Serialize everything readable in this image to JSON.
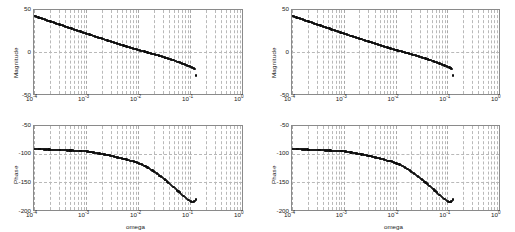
{
  "figure": {
    "background": "#ffffff",
    "marker_color": "#0d0d0d",
    "axis_color": "#8a8a8a",
    "grid_color": "#b9b9b9",
    "layout": "2 rows x 2 columns of Bode plots"
  },
  "panels": [
    {
      "id": "top-left",
      "kind": "magnitude",
      "ylabel": "Magnitude",
      "xlabel": "",
      "yticks": [
        "50",
        "0",
        "-50"
      ],
      "xticks": [
        "10",
        "10",
        "10",
        "10",
        "10"
      ],
      "xtick_exponents": [
        "-4",
        "-3",
        "-2",
        "-1",
        "0"
      ]
    },
    {
      "id": "top-right",
      "kind": "magnitude",
      "ylabel": "Magnitude",
      "xlabel": "",
      "yticks": [
        "50",
        "0",
        "-50"
      ],
      "xticks": [
        "10",
        "10",
        "10",
        "10",
        "10"
      ],
      "xtick_exponents": [
        "-4",
        "-3",
        "-2",
        "-1",
        "0"
      ]
    },
    {
      "id": "bottom-left",
      "kind": "phase",
      "ylabel": "Phase",
      "xlabel": "omega",
      "yticks": [
        "-50",
        "-100",
        "-150",
        "-200"
      ],
      "xticks": [
        "10",
        "10",
        "10",
        "10",
        "10"
      ],
      "xtick_exponents": [
        "-4",
        "-3",
        "-2",
        "-1",
        "0"
      ]
    },
    {
      "id": "bottom-right",
      "kind": "phase",
      "ylabel": "Phase",
      "xlabel": "omega",
      "yticks": [
        "-50",
        "-100",
        "-150",
        "-200"
      ],
      "xticks": [
        "10",
        "10",
        "10",
        "10",
        "10"
      ],
      "xtick_exponents": [
        "-4",
        "-3",
        "-2",
        "-1",
        "0"
      ]
    }
  ],
  "chart_data": [
    {
      "type": "scatter",
      "id": "top-left",
      "title": "",
      "xlabel": "",
      "ylabel": "Magnitude",
      "xscale": "log",
      "xlim": [
        0.0001,
        1
      ],
      "ylim": [
        -50,
        50
      ],
      "grid": true,
      "legend": null,
      "xtick_labels": [
        "10^-4",
        "10^-3",
        "10^-2",
        "10^-1",
        "10^0"
      ],
      "ytick_labels": [
        "50",
        "0",
        "-50"
      ],
      "x": [
        0.0001,
        0.001,
        0.002,
        0.003,
        0.004,
        0.005,
        0.006,
        0.007,
        0.008,
        0.009,
        0.01,
        0.012,
        0.014,
        0.016,
        0.018,
        0.02,
        0.023,
        0.026,
        0.03,
        0.034,
        0.038,
        0.043,
        0.048,
        0.054,
        0.06,
        0.067,
        0.075,
        0.084,
        0.094,
        0.105,
        0.115,
        0.125,
        0.13
      ],
      "y": [
        43,
        22,
        16,
        12.5,
        10,
        8,
        6.5,
        5.2,
        4.2,
        3.3,
        2.5,
        1.2,
        0.1,
        -0.8,
        -1.7,
        -2.5,
        -3.6,
        -4.6,
        -5.8,
        -6.8,
        -7.8,
        -8.9,
        -9.9,
        -11.0,
        -12.0,
        -13.1,
        -14.2,
        -15.4,
        -16.6,
        -17.9,
        -19.0,
        -20.0,
        -28
      ]
    },
    {
      "type": "scatter",
      "id": "top-right",
      "title": "",
      "xlabel": "",
      "ylabel": "Magnitude",
      "xscale": "log",
      "xlim": [
        0.0001,
        1
      ],
      "ylim": [
        -50,
        50
      ],
      "grid": true,
      "legend": null,
      "xtick_labels": [
        "10^-4",
        "10^-3",
        "10^-2",
        "10^-1",
        "10^0"
      ],
      "ytick_labels": [
        "50",
        "0",
        "-50"
      ],
      "x": [
        0.0001,
        0.001,
        0.002,
        0.003,
        0.004,
        0.005,
        0.006,
        0.007,
        0.008,
        0.009,
        0.01,
        0.012,
        0.014,
        0.016,
        0.018,
        0.02,
        0.023,
        0.026,
        0.03,
        0.034,
        0.038,
        0.043,
        0.048,
        0.054,
        0.06,
        0.067,
        0.075,
        0.084,
        0.094,
        0.105,
        0.115,
        0.125,
        0.13
      ],
      "y": [
        43,
        22,
        16,
        12.5,
        10,
        8,
        6.5,
        5.2,
        4.2,
        3.3,
        2.5,
        1.2,
        0.1,
        -0.8,
        -1.7,
        -2.5,
        -3.6,
        -4.6,
        -5.8,
        -6.8,
        -7.8,
        -8.9,
        -9.9,
        -11.0,
        -12.0,
        -13.1,
        -14.2,
        -15.4,
        -16.6,
        -17.9,
        -19.0,
        -20.0,
        -28
      ]
    },
    {
      "type": "scatter",
      "id": "bottom-left",
      "title": "",
      "xlabel": "omega",
      "ylabel": "Phase",
      "xscale": "log",
      "xlim": [
        0.0001,
        1
      ],
      "ylim": [
        -200,
        -50
      ],
      "grid": true,
      "legend": null,
      "xtick_labels": [
        "10^-4",
        "10^-3",
        "10^-2",
        "10^-1",
        "10^0"
      ],
      "ytick_labels": [
        "-50",
        "-100",
        "-150",
        "-200"
      ],
      "x": [
        0.0001,
        0.001,
        0.002,
        0.003,
        0.004,
        0.005,
        0.006,
        0.007,
        0.008,
        0.009,
        0.01,
        0.012,
        0.014,
        0.016,
        0.018,
        0.02,
        0.023,
        0.026,
        0.03,
        0.034,
        0.038,
        0.043,
        0.048,
        0.054,
        0.06,
        0.067,
        0.075,
        0.084,
        0.094,
        0.105,
        0.115,
        0.125,
        0.13
      ],
      "y": [
        -91,
        -95,
        -100,
        -103,
        -106,
        -108,
        -110,
        -112,
        -113,
        -114,
        -116,
        -119,
        -122,
        -125,
        -128,
        -131,
        -135,
        -139,
        -143,
        -147,
        -151,
        -155,
        -159,
        -163,
        -167,
        -171,
        -175,
        -179,
        -182,
        -185,
        -186,
        -184,
        -181
      ]
    },
    {
      "type": "scatter",
      "id": "bottom-right",
      "title": "",
      "xlabel": "omega",
      "ylabel": "Phase",
      "xscale": "log",
      "xlim": [
        0.0001,
        1
      ],
      "ylim": [
        -200,
        -50
      ],
      "grid": true,
      "legend": null,
      "xtick_labels": [
        "10^-4",
        "10^-3",
        "10^-2",
        "10^-1",
        "10^0"
      ],
      "ytick_labels": [
        "-50",
        "-100",
        "-150",
        "-200"
      ],
      "x": [
        0.0001,
        0.001,
        0.002,
        0.003,
        0.004,
        0.005,
        0.006,
        0.007,
        0.008,
        0.009,
        0.01,
        0.012,
        0.014,
        0.016,
        0.018,
        0.02,
        0.023,
        0.026,
        0.03,
        0.034,
        0.038,
        0.043,
        0.048,
        0.054,
        0.06,
        0.067,
        0.075,
        0.084,
        0.094,
        0.105,
        0.115,
        0.125,
        0.13
      ],
      "y": [
        -91,
        -95,
        -100,
        -103,
        -106,
        -108,
        -110,
        -112,
        -113,
        -114,
        -116,
        -119,
        -122,
        -125,
        -128,
        -131,
        -135,
        -139,
        -143,
        -147,
        -151,
        -155,
        -159,
        -163,
        -167,
        -171,
        -175,
        -179,
        -182,
        -185,
        -186,
        -184,
        -181
      ]
    }
  ]
}
